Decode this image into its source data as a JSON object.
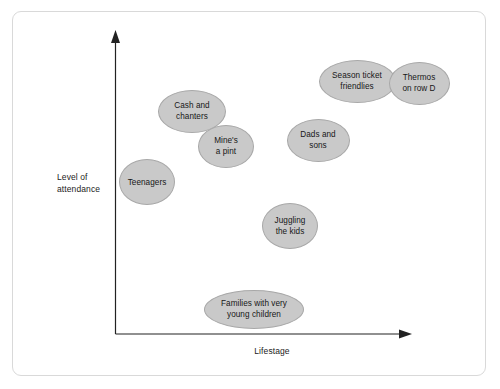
{
  "chart_data": {
    "type": "scatter",
    "title": "",
    "subtitle": "",
    "xlabel": "Lifestage",
    "ylabel": "Level of attendance",
    "xlim": [
      0,
      100
    ],
    "ylim": [
      0,
      100
    ],
    "grid": false,
    "legend": null,
    "axis_ticks": {
      "x": [],
      "y": []
    },
    "marker_shape": "ellipse",
    "marker_fill": "#c9c9c9",
    "marker_stroke": "#a8a8a8",
    "points": [
      {
        "label": "Teenagers",
        "x": 11,
        "y": 50,
        "px": 147,
        "py": 182,
        "w": 56,
        "h": 46
      },
      {
        "label": "Cash and\nchanters",
        "x": 26,
        "y": 74,
        "px": 192,
        "py": 111,
        "w": 68,
        "h": 43
      },
      {
        "label": "Mine's\na pint",
        "x": 37,
        "y": 62,
        "px": 226,
        "py": 146,
        "w": 56,
        "h": 43
      },
      {
        "label": "Juggling\nthe kids",
        "x": 59,
        "y": 36,
        "px": 290,
        "py": 226,
        "w": 56,
        "h": 46
      },
      {
        "label": "Dads and\nsons",
        "x": 68,
        "y": 64,
        "px": 318,
        "py": 140,
        "w": 63,
        "h": 43
      },
      {
        "label": "Season ticket\nfriendlies",
        "x": 81,
        "y": 84,
        "px": 357,
        "py": 81,
        "w": 77,
        "h": 43
      },
      {
        "label": "Thermos\non row D",
        "x": 102,
        "y": 83,
        "px": 419,
        "py": 83,
        "w": 61,
        "h": 43
      },
      {
        "label": "Families with very\nyoung children",
        "x": 47,
        "y": 8,
        "px": 254,
        "py": 309,
        "w": 100,
        "h": 39
      }
    ]
  },
  "axes": {
    "y_label": "Level of\nattendance",
    "x_label": "Lifestage"
  }
}
